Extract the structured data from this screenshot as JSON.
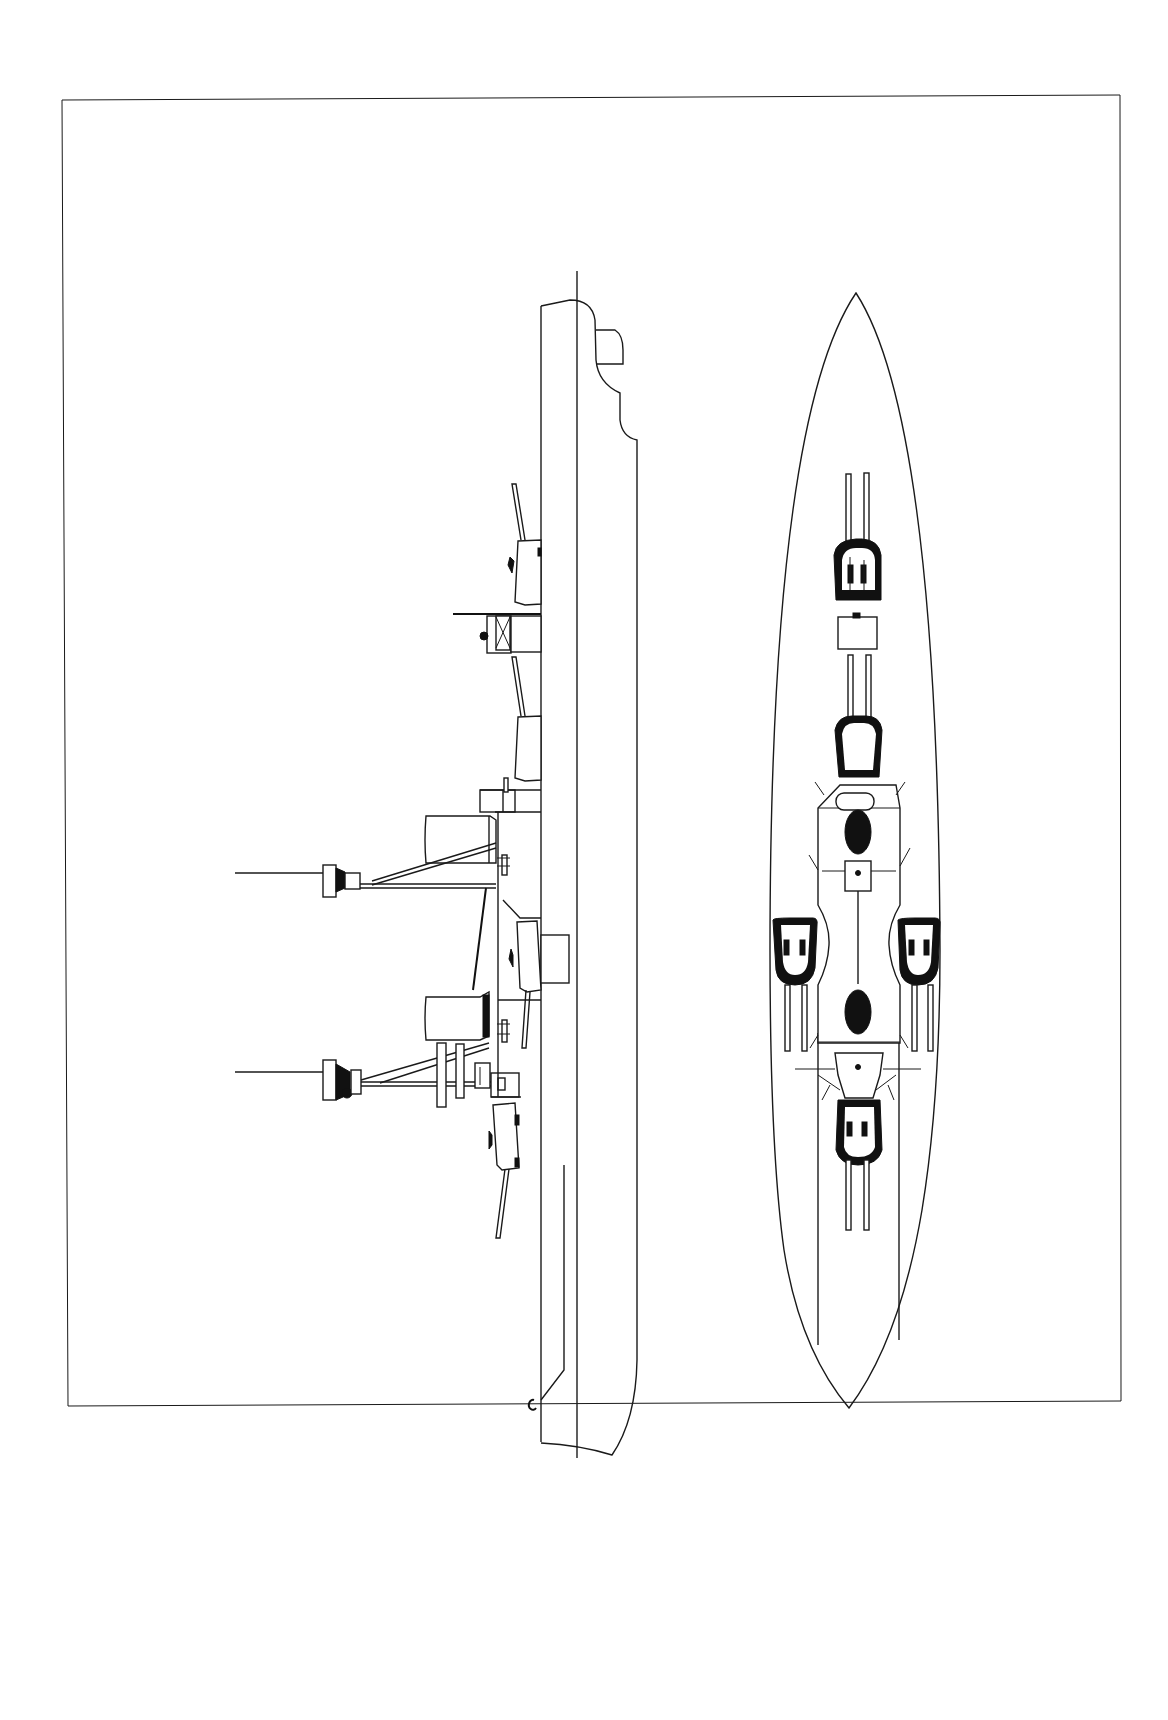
{
  "page": {
    "background": "#ffffff",
    "line_color": "#1a1a1a",
    "border": {
      "x": 62,
      "y": 96,
      "width": 1058,
      "height": 1310
    }
  },
  "figures": [
    {
      "id": "profile",
      "label": "",
      "view": "side elevation",
      "orientation": "bow at top"
    },
    {
      "id": "plan",
      "label": "",
      "view": "deck plan",
      "orientation": "bow at top"
    }
  ],
  "profile": {
    "turrets": [
      "forward-turret-a",
      "forward-turret-b",
      "wing-turret",
      "aft-turret"
    ],
    "masts": [
      "fore-mast",
      "main-mast"
    ],
    "funnels": [
      "fore-funnel",
      "aft-funnel"
    ]
  },
  "plan": {
    "turrets": [
      "turret-1",
      "turret-2",
      "turret-port-wing",
      "turret-starboard-wing",
      "turret-aft"
    ],
    "funnels": [
      "funnel-fore",
      "funnel-aft"
    ]
  }
}
